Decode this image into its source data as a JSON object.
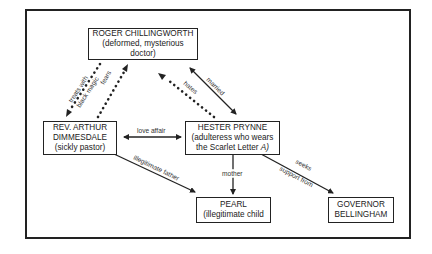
{
  "nodes": {
    "chillingworth": {
      "name": "ROGER CHILLINGWORTH",
      "desc1": "(deformed,  mysterious",
      "desc2": "doctor)"
    },
    "dimmesdale": {
      "name1": "REV. ARTHUR",
      "name2": "DIMMESDALE",
      "desc": "(sickly pastor)"
    },
    "hester": {
      "name": "HESTER PRYNNE",
      "desc1": "(adulteress who wears",
      "desc2": "the Scarlet Letter ",
      "desc2_italic": "A)"
    },
    "pearl": {
      "name": "PEARL",
      "desc": "(illegitimate child"
    },
    "bellingham": {
      "name1": "GOVERNOR",
      "name2": "BELLINGHAM"
    }
  },
  "edges": {
    "treats": {
      "line1": "treats with",
      "line2": "black magic",
      "style": "dotted"
    },
    "fears": {
      "label": "fears",
      "style": "dotted"
    },
    "hates": {
      "label": "hates",
      "style": "dotted"
    },
    "married": {
      "label": "married",
      "style": "solid-bidirectional"
    },
    "love_affair": {
      "label": "love affair",
      "style": "solid-bidirectional"
    },
    "illegitimate_father": {
      "label": "illegitimate father",
      "style": "solid"
    },
    "mother": {
      "label": "mother",
      "style": "solid"
    },
    "seeks": {
      "line1": "seeks",
      "line2": "support from",
      "style": "solid"
    }
  },
  "colors": {
    "ink": "#222222",
    "background": "#ffffff"
  }
}
